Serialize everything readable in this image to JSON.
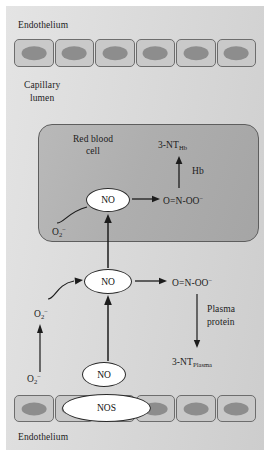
{
  "figure": {
    "background_color": "#dcdcdc",
    "rbc_box_color": "#b0b0b0",
    "cell_fill_color": "#c9c9c9",
    "nucleus_color": "#8d8d8d",
    "oval_fill_color": "#ffffff",
    "stroke_color": "#1c1c1c"
  },
  "labels": {
    "endothelium_top": "Endothelium",
    "capillary_lumen_line1": "Capillary",
    "capillary_lumen_line2": "lumen",
    "red_blood_cell_line1": "Red blood",
    "red_blood_cell_line2": "cell",
    "endothelium_bottom": "Endothelium"
  },
  "rbc_compartment": {
    "no_oval": "NO",
    "superoxide_base": "O",
    "superoxide_subscript": "2",
    "superoxide_superscript": "−",
    "peroxynitrite": "O=N-OO",
    "peroxynitrite_charge": "−",
    "hemoglobin": "Hb",
    "nitrotyrosine_base": "3-NT",
    "nitrotyrosine_subscript": "Hb"
  },
  "plasma_compartment": {
    "no_oval": "NO",
    "superoxide_base": "O",
    "superoxide_subscript": "2",
    "superoxide_superscript": "−",
    "peroxynitrite": "O=N-OO",
    "peroxynitrite_charge": "−",
    "plasma_protein_line1": "Plasma",
    "plasma_protein_line2": "protein",
    "nitrotyrosine_base": "3-NT",
    "nitrotyrosine_subscript": "Plasma"
  },
  "endothelium_compartment": {
    "no_oval": "NO",
    "nos_oval": "NOS",
    "superoxide_base": "O",
    "superoxide_subscript": "2",
    "superoxide_superscript": "−",
    "top_cell_count": 6,
    "bottom_cell_count": 6
  }
}
